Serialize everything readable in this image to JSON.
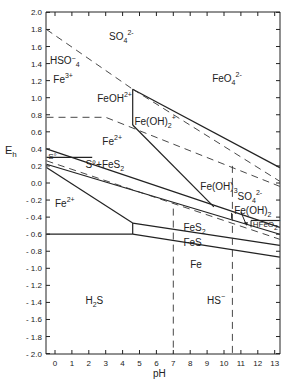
{
  "chart_data": {
    "type": "diagram",
    "title": "",
    "xlabel": "pH",
    "ylabel": "Eh",
    "xlim": [
      -0.5,
      13.3
    ],
    "ylim": [
      -2.0,
      2.0
    ],
    "x_ticks": [
      "0",
      "1",
      "2",
      "3",
      "4",
      "5",
      "6",
      "7",
      "8",
      "9",
      "10",
      "11",
      "12",
      "13"
    ],
    "y_ticks": [
      "2.0",
      "1.8",
      "1.6",
      "1.4",
      "1.2",
      "1.0",
      "0.8",
      "0.6",
      "0.4",
      "0.2",
      "0.0",
      "- 0.2",
      "- 0.4",
      "- 0.6",
      "- 0.8",
      "- 1.0",
      "- 1.2",
      "- 1.4",
      "- 1.6",
      "- 1.8",
      "- 2.0"
    ],
    "regions": {
      "so4": "SO4 2-",
      "hso4": "HSO-4",
      "fe3": "Fe3+",
      "feoh2": "FeOH2+",
      "feoh2plus": "Fe(OH)2+",
      "feo4": "FeO4 2-",
      "fe2_upper": "Fe2+",
      "s0": "S°",
      "s0_fes2": "S° + FeS2",
      "fe2_lower": "Fe 2+",
      "feoh3": "Fe(OH)3",
      "so4_right": "SO4 2-",
      "feoh2_right": "Fe(OH)2",
      "hfeo2": "HFeO2-",
      "fes2": "FeS2",
      "fes": "FeS",
      "fe": "Fe",
      "h2s": "H2S",
      "hs": "HS-"
    },
    "solid_lines": [
      {
        "name": "FeOH2+/Fe(OH)2+ boundary",
        "points": [
          [
            4.6,
            1.1
          ],
          [
            4.6,
            0.68
          ]
        ]
      },
      {
        "name": "Fe(OH)3 upper boundary",
        "points": [
          [
            4.6,
            1.1
          ],
          [
            13.3,
            0.18
          ]
        ]
      },
      {
        "name": "Fe2+/Fe(OH)2+ to Fe(OH)3",
        "points": [
          [
            4.6,
            0.68
          ],
          [
            9.4,
            -0.28
          ]
        ]
      },
      {
        "name": "Fe2+ / FeS2 upper",
        "points": [
          [
            -0.5,
            0.4
          ],
          [
            13.3,
            -0.52
          ]
        ]
      },
      {
        "name": "S° region top",
        "points": [
          [
            -0.5,
            0.3
          ],
          [
            2.2,
            0.3
          ]
        ]
      },
      {
        "name": "S° lower",
        "points": [
          [
            -0.5,
            0.22
          ],
          [
            13.3,
            -0.6
          ]
        ]
      },
      {
        "name": "Fe2+ / FeS2 lower",
        "points": [
          [
            -0.5,
            0.18
          ],
          [
            4.6,
            -0.47
          ]
        ]
      },
      {
        "name": "Fe2+ / Fe horizontal",
        "points": [
          [
            -0.5,
            -0.6
          ],
          [
            4.6,
            -0.6
          ]
        ]
      },
      {
        "name": "vertical at pH 4.6",
        "points": [
          [
            4.6,
            -0.47
          ],
          [
            4.6,
            -0.6
          ]
        ]
      },
      {
        "name": "FeS2/FeS",
        "points": [
          [
            4.6,
            -0.47
          ],
          [
            13.3,
            -0.73
          ]
        ]
      },
      {
        "name": "FeS/Fe",
        "points": [
          [
            4.6,
            -0.6
          ],
          [
            13.3,
            -0.87
          ]
        ]
      },
      {
        "name": "HFeO2- box",
        "points": [
          [
            11.6,
            -0.44
          ],
          [
            13.3,
            -0.44
          ]
        ]
      }
    ],
    "dashed_lines": [
      {
        "name": "HSO4/SO4",
        "points": [
          [
            -0.5,
            1.8
          ],
          [
            4.6,
            1.1
          ]
        ]
      },
      {
        "name": "SO4 dashed upper",
        "points": [
          [
            4.6,
            1.1
          ],
          [
            13.3,
            0.02
          ]
        ]
      },
      {
        "name": "Fe3+/Fe2+ ",
        "points": [
          [
            -0.5,
            0.77
          ],
          [
            3.0,
            0.77
          ],
          [
            13.3,
            -0.04
          ]
        ]
      },
      {
        "name": "sulfide dashed",
        "points": [
          [
            -0.5,
            0.26
          ],
          [
            13.3,
            -0.66
          ]
        ]
      },
      {
        "name": "pH 7 vertical",
        "points": [
          [
            7,
            -0.3
          ],
          [
            7,
            -2.0
          ]
        ]
      },
      {
        "name": "pH 10.5 vertical",
        "points": [
          [
            10.5,
            0.2
          ],
          [
            10.5,
            -2.0
          ]
        ]
      }
    ]
  },
  "axes": {
    "xlabel": "pH",
    "ylabel": "E",
    "ylabel_sub": "h"
  }
}
